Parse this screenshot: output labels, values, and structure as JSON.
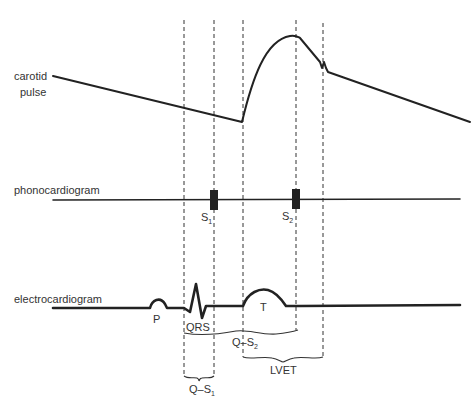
{
  "diagram": {
    "traces": {
      "carotid": {
        "label_line1": "carotid",
        "label_line2": "pulse"
      },
      "phono": {
        "label": "phonocardiogram",
        "s1": {
          "main": "S",
          "sub": "1"
        },
        "s2": {
          "main": "S",
          "sub": "2"
        }
      },
      "ecg": {
        "label": "electrocardiogram",
        "p": "P",
        "qrs": "QRS",
        "t": "T"
      }
    },
    "intervals": {
      "qs1": {
        "main": "Q–S",
        "sub": "1"
      },
      "qs2": {
        "main": "Q–S",
        "sub": "2"
      },
      "lvet": "LVET"
    },
    "colors": {
      "line": "#222222",
      "text": "#333333",
      "background": "#ffffff"
    }
  }
}
